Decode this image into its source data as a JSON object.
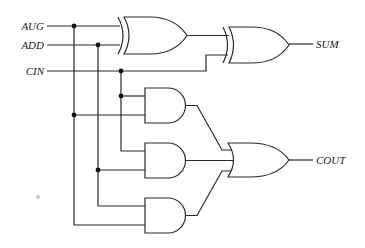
{
  "diagram": {
    "inputs": [
      {
        "label": "AUG",
        "y": 26
      },
      {
        "label": "ADD",
        "y": 45
      },
      {
        "label": "CIN",
        "y": 71
      }
    ],
    "outputs": [
      {
        "label": "SUM",
        "y": 44
      },
      {
        "label": "COUT",
        "y": 160
      }
    ],
    "gates": [
      {
        "id": "xor1",
        "type": "XOR",
        "inputs": [
          "AUG",
          "ADD"
        ]
      },
      {
        "id": "xor2",
        "type": "XOR",
        "inputs": [
          "xor1",
          "CIN"
        ],
        "output": "SUM"
      },
      {
        "id": "and1",
        "type": "AND",
        "inputs": [
          "CIN",
          "AUG"
        ]
      },
      {
        "id": "and2",
        "type": "AND",
        "inputs": [
          "CIN",
          "ADD"
        ]
      },
      {
        "id": "and3",
        "type": "AND",
        "inputs": [
          "ADD",
          "AUG"
        ]
      },
      {
        "id": "or1",
        "type": "OR",
        "inputs": [
          "and1",
          "and2",
          "and3"
        ],
        "output": "COUT"
      }
    ],
    "colors": {
      "line": "#2a2a2a",
      "background": "#ffffff"
    }
  }
}
